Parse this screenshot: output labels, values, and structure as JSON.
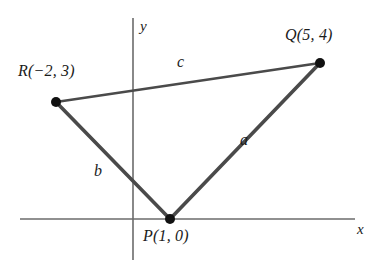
{
  "figure": {
    "type": "coordinate-geometry-diagram",
    "background_color": "#ffffff",
    "axis_color": "#6b6b6b",
    "side_color": "#4a4a4a",
    "vertex_dot_color": "#111111",
    "label_color": "#1b1b1b"
  },
  "axes": {
    "x_axis_label": "x",
    "y_axis_label": "y",
    "x_axis": {
      "x1": 20,
      "y1": 219,
      "x2": 355,
      "y2": 219
    },
    "y_axis": {
      "x1": 133,
      "y1": 18,
      "x2": 133,
      "y2": 260
    },
    "origin": {
      "x": 133,
      "y": 219
    },
    "ticks_shown": false,
    "grid": false
  },
  "vertices": [
    {
      "id": "P",
      "label": "P(1, 0)",
      "coords": [
        1,
        0
      ],
      "px": 170,
      "py": 219
    },
    {
      "id": "Q",
      "label": "Q(5, 4)",
      "coords": [
        5,
        4
      ],
      "px": 320,
      "py": 63
    },
    {
      "id": "R",
      "label": "R(−2, 3)",
      "coords": [
        -2,
        3
      ],
      "px": 56,
      "py": 102
    }
  ],
  "sides": [
    {
      "id": "a",
      "label": "a",
      "from": "P",
      "to": "Q",
      "stroke_width": 3.6
    },
    {
      "id": "b",
      "label": "b",
      "from": "R",
      "to": "P",
      "stroke_width": 3.6
    },
    {
      "id": "c",
      "label": "c",
      "from": "R",
      "to": "Q",
      "stroke_width": 2.6
    }
  ]
}
